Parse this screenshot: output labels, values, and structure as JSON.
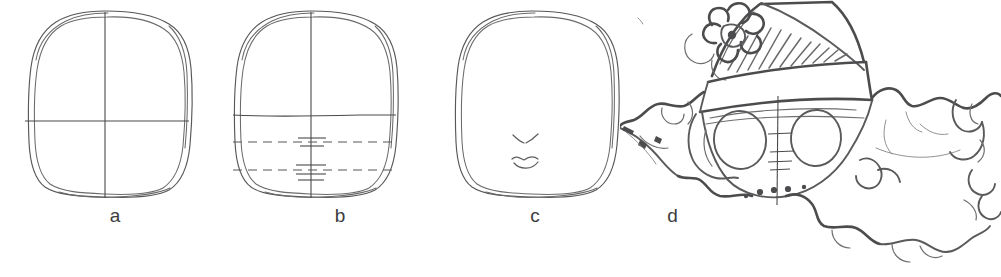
{
  "figure": {
    "type": "instructional-drawing-sequence",
    "background_color": "#ffffff",
    "ink_color": "#58585a",
    "panel_count": 4
  },
  "panels": [
    {
      "label": "a",
      "caption": "a",
      "description": "Hand-drawn egg-shaped head outline with a vertical centre line and a horizontal eye line forming a crosshair.",
      "elements": [
        "head-outline",
        "vertical-centre-line",
        "horizontal-eye-line"
      ]
    },
    {
      "label": "b",
      "caption": "b",
      "description": "Same head outline with the solid eye line plus two dashed horizontal guide lines for the nose and mouth, and small tick marks on the centre line.",
      "elements": [
        "head-outline",
        "vertical-centre-line",
        "horizontal-eye-line",
        "dashed-nose-line",
        "dashed-mouth-line",
        "centre-tick-marks"
      ]
    },
    {
      "label": "c",
      "caption": "c",
      "description": "Head outline with guidelines erased, showing only a small sketched nose and mouth.",
      "elements": [
        "head-outline",
        "nose",
        "mouth"
      ]
    },
    {
      "label": "d",
      "caption": "d",
      "description": "Finished character: a face wearing a tall hatched hat with a flower ornament and a wide band, framed by curly ruffled hair; two oval eyes and remaining construction ticks are visible.",
      "elements": [
        "hat-crown-hatched",
        "hat-flower",
        "hat-band",
        "face",
        "left-eye",
        "right-eye",
        "centre-construction-line",
        "curly-hair-left",
        "curly-hair-right",
        "scattered-dots"
      ]
    }
  ],
  "captions": {
    "a": "a",
    "b": "b",
    "c": "c",
    "d": "d"
  }
}
